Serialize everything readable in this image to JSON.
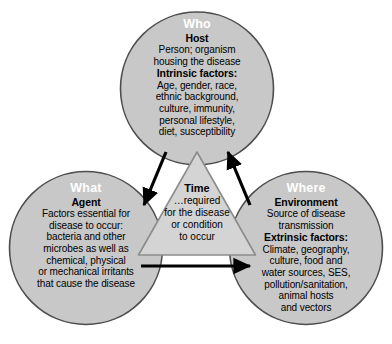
{
  "diagram": {
    "background_color": "#ffffff",
    "circle_fill": "#c8c8c8",
    "circle_stroke": "#4d4d4d",
    "triangle_fill": "#d4d4d4",
    "triangle_stroke": "#8c8c8c",
    "arrow_color": "#000000",
    "label_text_color": "#ffffff",
    "body_text_color": "#000000"
  },
  "who": {
    "zone_label": "Who",
    "heading": "Host",
    "lines": [
      "Person; organism",
      "housing the disease"
    ],
    "factors_heading": "Intrinsic factors:",
    "factors_lines": [
      "Age, gender, race,",
      "ethnic background,",
      "culture, immunity,",
      "personal lifestyle,",
      "diet, susceptibility"
    ]
  },
  "what": {
    "zone_label": "What",
    "heading": "Agent",
    "lines": [
      "Factors essential for",
      "disease to occur:",
      "bacteria and other",
      "microbes as well as",
      "chemical, physical",
      "or mechanical irritants",
      "that cause the disease"
    ]
  },
  "where": {
    "zone_label": "Where",
    "heading": "Environment",
    "lines": [
      "Source of disease",
      "transmission"
    ],
    "factors_heading": "Extrinsic factors:",
    "factors_lines": [
      "Climate, geography,",
      "culture, food and",
      "water sources, SES,",
      "pollution/sanitation,",
      "animal hosts",
      "and vectors"
    ]
  },
  "time": {
    "heading": "Time",
    "lines": [
      "…required",
      "for the disease",
      "or condition",
      "to occur"
    ]
  },
  "arrows": [
    {
      "name": "who-to-what",
      "from": "who",
      "to": "what",
      "direction": "down-left"
    },
    {
      "name": "where-to-who",
      "from": "where",
      "to": "who",
      "direction": "up-right"
    },
    {
      "name": "what-to-where",
      "from": "what",
      "to": "where",
      "direction": "right"
    }
  ]
}
